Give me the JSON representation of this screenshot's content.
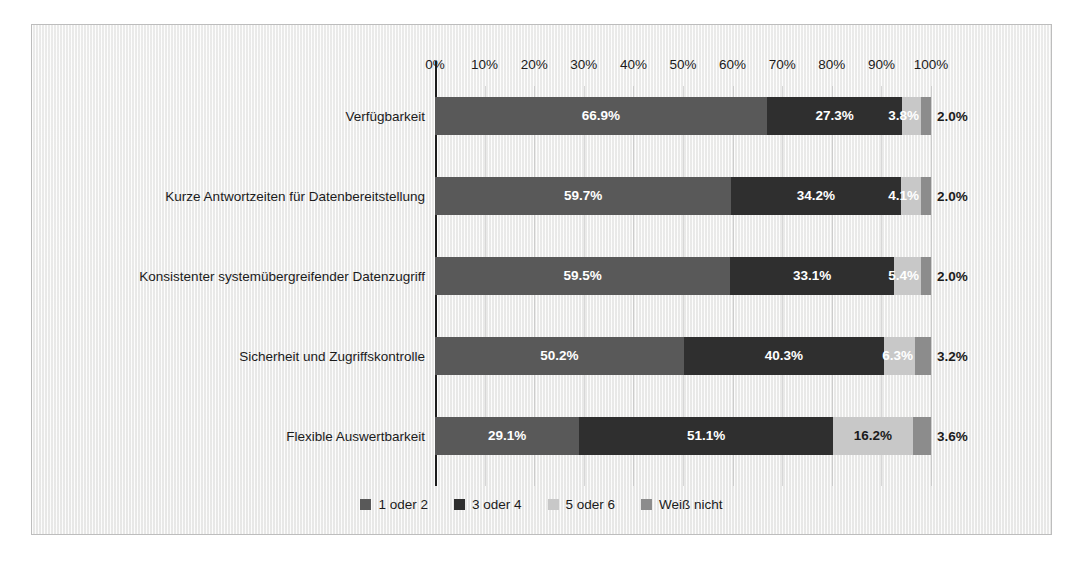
{
  "chart_data": {
    "type": "bar",
    "orientation": "horizontal",
    "stacked": true,
    "normalized": true,
    "title": "",
    "subtitle": "",
    "xlabel": "",
    "ylabel": "",
    "xlim": [
      0,
      100
    ],
    "grid": true,
    "legend_position": "bottom",
    "xtick_labels": [
      "0%",
      "10%",
      "20%",
      "30%",
      "40%",
      "50%",
      "60%",
      "70%",
      "80%",
      "90%",
      "100%"
    ],
    "xtick_values": [
      0,
      10,
      20,
      30,
      40,
      50,
      60,
      70,
      80,
      90,
      100
    ],
    "categories": [
      "Verfügbarkeit",
      "Kurze Antwortzeiten für Datenbereitstellung",
      "Konsistenter systemübergreifender Datenzugriff",
      "Sicherheit und Zugriffskontrolle",
      "Flexible Auswertbarkeit"
    ],
    "series": [
      {
        "name": "1 oder 2",
        "color": "#595959",
        "values": [
          66.9,
          59.7,
          59.5,
          50.2,
          29.1
        ],
        "labels": [
          "66.9%",
          "59.7%",
          "59.5%",
          "50.2%",
          "29.1%"
        ]
      },
      {
        "name": "3 oder 4",
        "color": "#2f2f2f",
        "values": [
          27.3,
          34.2,
          33.1,
          40.3,
          51.1
        ],
        "labels": [
          "27.3%",
          "34.2%",
          "33.1%",
          "40.3%",
          "51.1%"
        ]
      },
      {
        "name": "5 oder 6",
        "color": "#c8c8c8",
        "values": [
          3.8,
          4.1,
          5.4,
          6.3,
          16.2
        ],
        "labels": [
          "3.8%",
          "4.1%",
          "5.4%",
          "6.3%",
          "16.2%"
        ]
      },
      {
        "name": "Weiß nicht",
        "color": "#8c8c8c",
        "values": [
          2.0,
          2.0,
          2.0,
          3.2,
          3.6
        ],
        "labels": [
          "2.0%",
          "2.0%",
          "2.0%",
          "3.2%",
          "3.6%"
        ]
      }
    ]
  },
  "legend": {
    "items": [
      {
        "label": "1 oder 2",
        "color": "#595959"
      },
      {
        "label": "3 oder 4",
        "color": "#2f2f2f"
      },
      {
        "label": "5 oder 6",
        "color": "#c8c8c8"
      },
      {
        "label": "Weiß nicht",
        "color": "#8c8c8c"
      }
    ]
  }
}
